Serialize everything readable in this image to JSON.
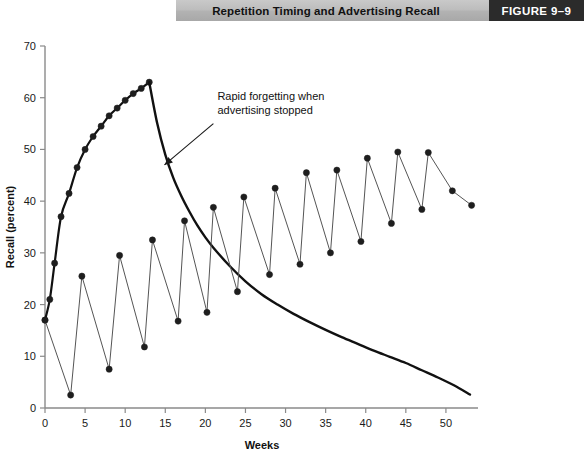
{
  "header": {
    "title": "Repetition Timing and Advertising Recall",
    "figure_tag": "FIGURE  9–9",
    "band_color": "#b5b5b5",
    "tag_band_color": "#2b2b2b"
  },
  "chart_data": {
    "type": "line",
    "title": "Repetition Timing and Advertising Recall",
    "xlabel": "Weeks",
    "ylabel": "Recall (percent)",
    "xlim": [
      0,
      54
    ],
    "ylim": [
      0,
      70
    ],
    "xticks": [
      0,
      5,
      10,
      15,
      20,
      25,
      30,
      35,
      40,
      45,
      50
    ],
    "yticks": [
      0,
      10,
      20,
      30,
      40,
      50,
      60,
      70
    ],
    "xtick_labels": [
      "0",
      "5",
      "10",
      "15",
      "20",
      "25",
      "30",
      "35",
      "40",
      "45",
      "50"
    ],
    "ytick_labels": [
      "0",
      "10",
      "20",
      "30",
      "40",
      "50",
      "60",
      "70"
    ],
    "grid": false,
    "legend": "none",
    "annotations": [
      {
        "text_line1": "Rapid forgetting when",
        "text_line2": "advertising stopped",
        "x_text": 21.5,
        "y_text": 59.5,
        "arrow_from": [
          21.0,
          55.0
        ],
        "arrow_to": [
          14.9,
          47.0
        ]
      }
    ],
    "series": [
      {
        "name": "Continuous advertising then stopped",
        "style": "thick-line-with-markers",
        "color": "#111111",
        "marker": "circle",
        "line_width": 2.2,
        "x": [
          0,
          0.6,
          1.2,
          2,
          3,
          4,
          5,
          6,
          7,
          8,
          9,
          10,
          11,
          12,
          13
        ],
        "y": [
          17,
          21,
          28,
          37,
          41.5,
          46.5,
          50,
          52.5,
          54.5,
          56.5,
          58,
          59.5,
          60.8,
          61.8,
          63
        ]
      },
      {
        "name": "Forgetting decay after advertising stopped",
        "style": "thick-line-no-markers",
        "color": "#111111",
        "marker": "none",
        "line_width": 2.4,
        "x": [
          13,
          14,
          15,
          16,
          17,
          18,
          19,
          20,
          21,
          23,
          25,
          27,
          29,
          31,
          33,
          35,
          37,
          39,
          41,
          43,
          45,
          47,
          49,
          51,
          53
        ],
        "y": [
          63,
          55,
          49,
          44.5,
          41,
          38,
          35.3,
          33,
          31,
          27.5,
          24.5,
          22,
          20,
          18.2,
          16.6,
          15.1,
          13.7,
          12.4,
          11.1,
          9.9,
          8.7,
          7.3,
          5.9,
          4.4,
          2.6
        ]
      },
      {
        "name": "Pulsing (flighted) advertising",
        "style": "thin-line-with-markers",
        "color": "#555555",
        "marker": "circle",
        "line_width": 1.0,
        "x": [
          0,
          3.2,
          4.6,
          8.0,
          9.3,
          12.4,
          13.4,
          16.6,
          17.4,
          20.2,
          21.0,
          24.0,
          24.8,
          28.0,
          28.7,
          31.8,
          32.6,
          35.6,
          36.4,
          39.4,
          40.2,
          43.2,
          44.0,
          47.0,
          47.8,
          50.8,
          53.2
        ],
        "y": [
          17,
          2.5,
          25.5,
          7.5,
          29.5,
          11.8,
          32.5,
          16.8,
          36.2,
          18.5,
          38.8,
          22.5,
          40.8,
          25.8,
          42.5,
          27.8,
          45.5,
          30.0,
          46.0,
          32.2,
          48.3,
          35.7,
          49.5,
          38.4,
          49.4,
          42.0,
          39.2
        ]
      }
    ]
  }
}
